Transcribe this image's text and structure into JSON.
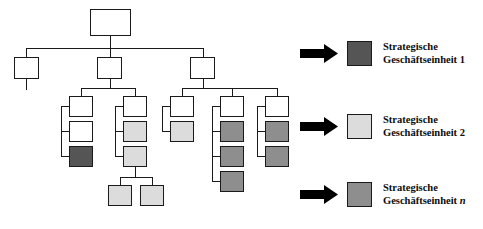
{
  "diagram": {
    "colors": {
      "white": "#ffffff",
      "light_gray": "#dcdcdc",
      "mid_gray": "#8e8e8e",
      "dark_gray": "#555555",
      "outline": "#1a1a1a",
      "arrow": "#000000"
    },
    "nodes": [
      {
        "id": "root",
        "x": 90,
        "y": 9,
        "w": 41,
        "h": 27,
        "fill": "white"
      },
      {
        "id": "l1-a",
        "x": 14,
        "y": 57,
        "w": 25,
        "h": 22,
        "fill": "white"
      },
      {
        "id": "l1-b",
        "x": 97,
        "y": 57,
        "w": 25,
        "h": 22,
        "fill": "white"
      },
      {
        "id": "l1-c",
        "x": 190,
        "y": 57,
        "w": 25,
        "h": 22,
        "fill": "white"
      },
      {
        "id": "l2-a",
        "x": 69,
        "y": 96,
        "w": 24,
        "h": 21,
        "fill": "white"
      },
      {
        "id": "l2-a1",
        "x": 69,
        "y": 121,
        "w": 24,
        "h": 21,
        "fill": "white"
      },
      {
        "id": "l2-a2",
        "x": 69,
        "y": 146,
        "w": 24,
        "h": 21,
        "fill": "dark"
      },
      {
        "id": "l2-b",
        "x": 123,
        "y": 96,
        "w": 24,
        "h": 21,
        "fill": "white"
      },
      {
        "id": "l2-b1",
        "x": 123,
        "y": 121,
        "w": 24,
        "h": 21,
        "fill": "light"
      },
      {
        "id": "l2-b2",
        "x": 123,
        "y": 146,
        "w": 24,
        "h": 21,
        "fill": "light"
      },
      {
        "id": "l2-b2x",
        "x": 108,
        "y": 185,
        "w": 24,
        "h": 21,
        "fill": "light"
      },
      {
        "id": "l2-b2y",
        "x": 140,
        "y": 185,
        "w": 24,
        "h": 21,
        "fill": "light"
      },
      {
        "id": "l2-c",
        "x": 170,
        "y": 96,
        "w": 24,
        "h": 21,
        "fill": "white"
      },
      {
        "id": "l2-c1",
        "x": 170,
        "y": 121,
        "w": 24,
        "h": 21,
        "fill": "light"
      },
      {
        "id": "l2-d",
        "x": 220,
        "y": 96,
        "w": 24,
        "h": 21,
        "fill": "white"
      },
      {
        "id": "l2-d1",
        "x": 220,
        "y": 121,
        "w": 24,
        "h": 21,
        "fill": "mid"
      },
      {
        "id": "l2-d2",
        "x": 220,
        "y": 146,
        "w": 24,
        "h": 21,
        "fill": "mid"
      },
      {
        "id": "l2-d3",
        "x": 220,
        "y": 171,
        "w": 24,
        "h": 21,
        "fill": "mid"
      },
      {
        "id": "l2-e",
        "x": 265,
        "y": 96,
        "w": 24,
        "h": 21,
        "fill": "white"
      },
      {
        "id": "l2-e1",
        "x": 265,
        "y": 121,
        "w": 24,
        "h": 21,
        "fill": "mid"
      },
      {
        "id": "l2-e2",
        "x": 265,
        "y": 146,
        "w": 24,
        "h": 21,
        "fill": "mid"
      }
    ],
    "connectors": [
      {
        "o": "v",
        "x": 110,
        "y": 36,
        "len": 13
      },
      {
        "o": "h",
        "x": 26,
        "y": 48,
        "len": 177
      },
      {
        "o": "v",
        "x": 26,
        "y": 48,
        "len": 10
      },
      {
        "o": "v",
        "x": 110,
        "y": 48,
        "len": 10
      },
      {
        "o": "v",
        "x": 203,
        "y": 48,
        "len": 10
      },
      {
        "o": "v",
        "x": 26,
        "y": 79,
        "len": 11
      },
      {
        "o": "v",
        "x": 110,
        "y": 79,
        "len": 10
      },
      {
        "o": "h",
        "x": 81,
        "y": 88,
        "len": 55
      },
      {
        "o": "v",
        "x": 81,
        "y": 88,
        "len": 9
      },
      {
        "o": "v",
        "x": 135,
        "y": 88,
        "len": 9
      },
      {
        "o": "v",
        "x": 203,
        "y": 79,
        "len": 10
      },
      {
        "o": "h",
        "x": 182,
        "y": 88,
        "len": 95
      },
      {
        "o": "v",
        "x": 182,
        "y": 88,
        "len": 9
      },
      {
        "o": "v",
        "x": 232,
        "y": 88,
        "len": 9
      },
      {
        "o": "v",
        "x": 277,
        "y": 88,
        "len": 9
      },
      {
        "o": "v",
        "x": 61,
        "y": 106,
        "len": 51
      },
      {
        "o": "h",
        "x": 61,
        "y": 106,
        "len": 9
      },
      {
        "o": "h",
        "x": 61,
        "y": 131,
        "len": 9
      },
      {
        "o": "h",
        "x": 61,
        "y": 156,
        "len": 9
      },
      {
        "o": "v",
        "x": 115,
        "y": 106,
        "len": 51
      },
      {
        "o": "h",
        "x": 115,
        "y": 106,
        "len": 9
      },
      {
        "o": "h",
        "x": 115,
        "y": 131,
        "len": 9
      },
      {
        "o": "h",
        "x": 115,
        "y": 156,
        "len": 9
      },
      {
        "o": "v",
        "x": 135,
        "y": 167,
        "len": 10
      },
      {
        "o": "h",
        "x": 120,
        "y": 177,
        "len": 32
      },
      {
        "o": "v",
        "x": 120,
        "y": 177,
        "len": 9
      },
      {
        "o": "v",
        "x": 152,
        "y": 177,
        "len": 9
      },
      {
        "o": "v",
        "x": 162,
        "y": 106,
        "len": 26
      },
      {
        "o": "h",
        "x": 162,
        "y": 106,
        "len": 9
      },
      {
        "o": "h",
        "x": 162,
        "y": 131,
        "len": 9
      },
      {
        "o": "v",
        "x": 212,
        "y": 106,
        "len": 76
      },
      {
        "o": "h",
        "x": 212,
        "y": 106,
        "len": 9
      },
      {
        "o": "h",
        "x": 212,
        "y": 131,
        "len": 9
      },
      {
        "o": "h",
        "x": 212,
        "y": 156,
        "len": 9
      },
      {
        "o": "h",
        "x": 212,
        "y": 181,
        "len": 9
      },
      {
        "o": "v",
        "x": 257,
        "y": 106,
        "len": 51
      },
      {
        "o": "h",
        "x": 257,
        "y": 106,
        "len": 9
      },
      {
        "o": "h",
        "x": 257,
        "y": 131,
        "len": 9
      },
      {
        "o": "h",
        "x": 257,
        "y": 156,
        "len": 9
      }
    ]
  },
  "legend": {
    "items": [
      {
        "id": "sbu-1",
        "x": 300,
        "y": 40,
        "swatch": "dark",
        "line1": "Strategische",
        "line2_prefix": "Geschäftseinheit ",
        "line2_suffix": "1",
        "suffix_italic": false
      },
      {
        "id": "sbu-2",
        "x": 300,
        "y": 113,
        "swatch": "light",
        "line1": "Strategische",
        "line2_prefix": "Geschäftseinheit ",
        "line2_suffix": "2",
        "suffix_italic": false
      },
      {
        "id": "sbu-n",
        "x": 300,
        "y": 181,
        "swatch": "mid",
        "line1": "Strategische",
        "line2_prefix": "Geschäftseinheit ",
        "line2_suffix": "n",
        "suffix_italic": true
      }
    ]
  }
}
